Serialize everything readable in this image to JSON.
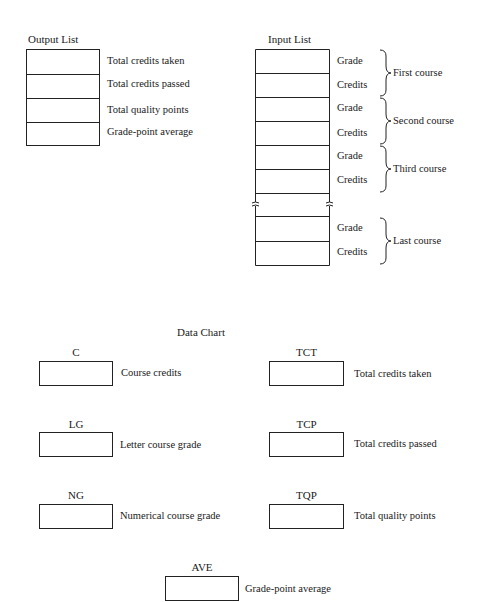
{
  "output_list": {
    "title": "Output List",
    "rows": [
      {
        "label": "Total credits taken"
      },
      {
        "label": "Total credits passed"
      },
      {
        "label": "Total quality points"
      },
      {
        "label": "Grade-point average"
      }
    ]
  },
  "input_list": {
    "title": "Input List",
    "groups": [
      {
        "course": "First course",
        "rows": [
          "Grade",
          "Credits"
        ]
      },
      {
        "course": "Second course",
        "rows": [
          "Grade",
          "Credits"
        ]
      },
      {
        "course": "Third course",
        "rows": [
          "Grade",
          "Credits"
        ]
      },
      {
        "course": "Last course",
        "rows": [
          "Grade",
          "Credits"
        ]
      }
    ],
    "break_marker": "≈"
  },
  "data_chart": {
    "title": "Data Chart",
    "items": [
      {
        "var": "C",
        "desc": "Course credits"
      },
      {
        "var": "TCT",
        "desc": "Total credits taken"
      },
      {
        "var": "LG",
        "desc": "Letter course grade"
      },
      {
        "var": "TCP",
        "desc": "Total credits passed"
      },
      {
        "var": "NG",
        "desc": "Numerical course grade"
      },
      {
        "var": "TQP",
        "desc": "Total quality points"
      },
      {
        "var": "AVE",
        "desc": "Grade-point average"
      }
    ]
  }
}
